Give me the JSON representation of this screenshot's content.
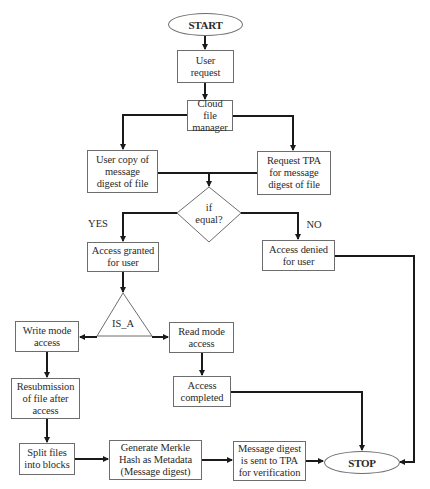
{
  "diagram": {
    "type": "flowchart",
    "terminals": {
      "start": "START",
      "stop": "STOP"
    },
    "nodes": {
      "user_request": "User\nrequest",
      "cloud_manager": "Cloud file\nmanager",
      "user_copy": "User copy of\nmessage\ndigest of file",
      "request_tpa": "Request TPA\nfor message\ndigest of file",
      "decision": "if\nequal?",
      "access_granted": "Access granted\nfor user",
      "access_denied": "Access denied\nfor user",
      "is_a": "IS_A",
      "write_mode": "Write mode\naccess",
      "read_mode": "Read mode\naccess",
      "resubmission": "Resubmission\nof file after\naccess",
      "access_completed": "Access\ncompleted",
      "split_files": "Split files\ninto blocks",
      "generate_merkle": "Generate Merkle\nHash as Metadata\n(Message digest)",
      "digest_sent": "Message digest\nis sent to TPA\nfor verification"
    },
    "edge_labels": {
      "yes": "YES",
      "no": "NO"
    },
    "edges": [
      {
        "from": "START",
        "to": "User request"
      },
      {
        "from": "User request",
        "to": "Cloud file manager"
      },
      {
        "from": "Cloud file manager",
        "to": "User copy of message digest of file"
      },
      {
        "from": "Cloud file manager",
        "to": "Request TPA for message digest of file"
      },
      {
        "from": "User copy of message digest of file",
        "to": "if equal?"
      },
      {
        "from": "Request TPA for message digest of file",
        "to": "if equal?"
      },
      {
        "from": "if equal?",
        "to": "Access granted for user",
        "label": "YES"
      },
      {
        "from": "if equal?",
        "to": "Access denied for user",
        "label": "NO"
      },
      {
        "from": "Access granted for user",
        "to": "IS_A"
      },
      {
        "from": "IS_A",
        "to": "Write mode access"
      },
      {
        "from": "IS_A",
        "to": "Read mode access"
      },
      {
        "from": "Write mode access",
        "to": "Resubmission of file after access"
      },
      {
        "from": "Resubmission of file after access",
        "to": "Split files into blocks"
      },
      {
        "from": "Split files into blocks",
        "to": "Generate Merkle Hash as Metadata (Message digest)"
      },
      {
        "from": "Generate Merkle Hash as Metadata (Message digest)",
        "to": "Message digest is sent to TPA for verification"
      },
      {
        "from": "Message digest is sent to TPA for verification",
        "to": "STOP"
      },
      {
        "from": "Read mode access",
        "to": "Access completed"
      },
      {
        "from": "Access completed",
        "to": "STOP"
      },
      {
        "from": "Access denied for user",
        "to": "STOP"
      }
    ],
    "colors": {
      "line": "#1a1a1a",
      "border": "#6d6d6d",
      "background": "#ffffff"
    }
  }
}
